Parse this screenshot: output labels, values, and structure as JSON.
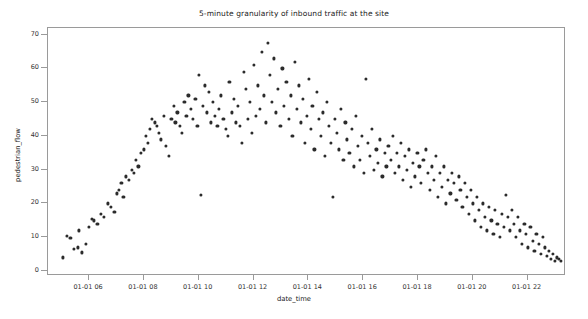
{
  "chart_data": {
    "type": "scatter",
    "title": "5-minute granularity of inbound traffic at the site",
    "xlabel": "date_time",
    "ylabel": "pedestrian_flow",
    "grid": false,
    "legend": null,
    "marker": {
      "color": "#2b2b2b",
      "size": 3,
      "shape": "circle"
    },
    "xlim": [
      4.5,
      23.4
    ],
    "ylim": [
      -1.5,
      72
    ],
    "ytick_values": [
      0,
      10,
      20,
      30,
      40,
      50,
      60,
      70
    ],
    "ytick_labels": [
      "0",
      "10",
      "20",
      "30",
      "40",
      "50",
      "60",
      "70"
    ],
    "xtick_values": [
      6,
      8,
      10,
      12,
      14,
      16,
      18,
      20,
      22
    ],
    "xtick_labels": [
      "01-01 06",
      "01-01 08",
      "01-01 10",
      "01-01 12",
      "01-01 14",
      "01-01 16",
      "01-01 18",
      "01-01 20",
      "01-01 22"
    ],
    "x_unit": "hour of 01-01",
    "points": [
      [
        5.05,
        4.0
      ],
      [
        5.2,
        10.5
      ],
      [
        5.32,
        9.8
      ],
      [
        5.45,
        6.5
      ],
      [
        5.58,
        7.0
      ],
      [
        5.62,
        12.0
      ],
      [
        5.75,
        5.5
      ],
      [
        5.88,
        8.0
      ],
      [
        6.0,
        13.0
      ],
      [
        6.1,
        15.5
      ],
      [
        6.18,
        15.0
      ],
      [
        6.3,
        14.0
      ],
      [
        6.42,
        17.0
      ],
      [
        6.55,
        16.0
      ],
      [
        6.68,
        20.0
      ],
      [
        6.8,
        19.0
      ],
      [
        6.92,
        17.5
      ],
      [
        7.0,
        23.0
      ],
      [
        7.08,
        24.0
      ],
      [
        7.18,
        26.0
      ],
      [
        7.25,
        22.0
      ],
      [
        7.35,
        28.0
      ],
      [
        7.45,
        27.0
      ],
      [
        7.55,
        30.0
      ],
      [
        7.62,
        29.0
      ],
      [
        7.7,
        33.0
      ],
      [
        7.8,
        31.0
      ],
      [
        7.9,
        35.0
      ],
      [
        8.0,
        36.0
      ],
      [
        8.08,
        40.0
      ],
      [
        8.15,
        38.0
      ],
      [
        8.22,
        42.0
      ],
      [
        8.3,
        45.0
      ],
      [
        8.4,
        44.0
      ],
      [
        8.48,
        43.0
      ],
      [
        8.55,
        41.0
      ],
      [
        8.62,
        39.0
      ],
      [
        8.72,
        46.0
      ],
      [
        8.8,
        37.0
      ],
      [
        8.9,
        34.0
      ],
      [
        9.0,
        45.0
      ],
      [
        9.08,
        49.0
      ],
      [
        9.15,
        44.0
      ],
      [
        9.22,
        47.0
      ],
      [
        9.3,
        43.0
      ],
      [
        9.4,
        41.0
      ],
      [
        9.48,
        50.0
      ],
      [
        9.55,
        46.0
      ],
      [
        9.62,
        52.0
      ],
      [
        9.72,
        48.0
      ],
      [
        9.8,
        45.0
      ],
      [
        9.88,
        51.0
      ],
      [
        9.95,
        43.0
      ],
      [
        10.02,
        58.0
      ],
      [
        10.08,
        22.5
      ],
      [
        10.15,
        49.0
      ],
      [
        10.22,
        55.0
      ],
      [
        10.3,
        47.0
      ],
      [
        10.38,
        53.0
      ],
      [
        10.45,
        44.0
      ],
      [
        10.52,
        50.0
      ],
      [
        10.6,
        46.0
      ],
      [
        10.68,
        43.0
      ],
      [
        10.75,
        48.0
      ],
      [
        10.82,
        52.0
      ],
      [
        10.9,
        45.0
      ],
      [
        10.98,
        42.0
      ],
      [
        11.05,
        40.0
      ],
      [
        11.12,
        56.0
      ],
      [
        11.2,
        47.0
      ],
      [
        11.28,
        51.0
      ],
      [
        11.35,
        44.0
      ],
      [
        11.42,
        49.0
      ],
      [
        11.5,
        43.0
      ],
      [
        11.58,
        38.0
      ],
      [
        11.65,
        59.0
      ],
      [
        11.72,
        54.0
      ],
      [
        11.8,
        45.0
      ],
      [
        11.88,
        50.0
      ],
      [
        11.95,
        41.0
      ],
      [
        12.02,
        61.0
      ],
      [
        12.08,
        46.0
      ],
      [
        12.15,
        55.0
      ],
      [
        12.22,
        48.0
      ],
      [
        12.3,
        65.0
      ],
      [
        12.38,
        52.0
      ],
      [
        12.45,
        44.0
      ],
      [
        12.52,
        67.5
      ],
      [
        12.6,
        58.0
      ],
      [
        12.68,
        50.0
      ],
      [
        12.75,
        63.0
      ],
      [
        12.82,
        47.0
      ],
      [
        12.9,
        54.0
      ],
      [
        12.98,
        43.0
      ],
      [
        13.05,
        60.0
      ],
      [
        13.12,
        49.0
      ],
      [
        13.2,
        56.0
      ],
      [
        13.28,
        45.0
      ],
      [
        13.35,
        52.0
      ],
      [
        13.42,
        40.0
      ],
      [
        13.5,
        62.0
      ],
      [
        13.58,
        48.0
      ],
      [
        13.65,
        55.0
      ],
      [
        13.72,
        44.0
      ],
      [
        13.8,
        51.0
      ],
      [
        13.88,
        38.0
      ],
      [
        13.95,
        46.0
      ],
      [
        14.02,
        57.0
      ],
      [
        14.08,
        42.0
      ],
      [
        14.15,
        49.0
      ],
      [
        14.22,
        36.0
      ],
      [
        14.3,
        53.0
      ],
      [
        14.38,
        45.0
      ],
      [
        14.45,
        40.0
      ],
      [
        14.52,
        47.0
      ],
      [
        14.6,
        34.0
      ],
      [
        14.68,
        50.0
      ],
      [
        14.75,
        43.0
      ],
      [
        14.82,
        38.0
      ],
      [
        14.9,
        22.0
      ],
      [
        14.98,
        45.0
      ],
      [
        15.05,
        41.0
      ],
      [
        15.12,
        36.0
      ],
      [
        15.2,
        48.0
      ],
      [
        15.28,
        33.0
      ],
      [
        15.35,
        44.0
      ],
      [
        15.42,
        39.0
      ],
      [
        15.5,
        35.0
      ],
      [
        15.58,
        42.0
      ],
      [
        15.65,
        31.0
      ],
      [
        15.72,
        46.0
      ],
      [
        15.8,
        37.0
      ],
      [
        15.88,
        33.0
      ],
      [
        15.95,
        40.0
      ],
      [
        16.02,
        29.0
      ],
      [
        16.1,
        57.0
      ],
      [
        16.18,
        38.0
      ],
      [
        16.25,
        34.0
      ],
      [
        16.32,
        42.0
      ],
      [
        16.4,
        30.0
      ],
      [
        16.48,
        36.0
      ],
      [
        16.55,
        32.0
      ],
      [
        16.62,
        39.0
      ],
      [
        16.7,
        28.0
      ],
      [
        16.78,
        35.0
      ],
      [
        16.85,
        31.0
      ],
      [
        16.92,
        37.0
      ],
      [
        17.0,
        33.0
      ],
      [
        17.08,
        40.0
      ],
      [
        17.15,
        29.0
      ],
      [
        17.22,
        35.0
      ],
      [
        17.3,
        31.0
      ],
      [
        17.38,
        38.0
      ],
      [
        17.45,
        27.0
      ],
      [
        17.52,
        34.0
      ],
      [
        17.6,
        30.0
      ],
      [
        17.68,
        36.0
      ],
      [
        17.75,
        25.0
      ],
      [
        17.82,
        32.0
      ],
      [
        17.9,
        28.0
      ],
      [
        17.98,
        35.0
      ],
      [
        18.05,
        31.0
      ],
      [
        18.12,
        26.0
      ],
      [
        18.2,
        33.0
      ],
      [
        18.28,
        36.0
      ],
      [
        18.35,
        29.0
      ],
      [
        18.42,
        24.0
      ],
      [
        18.5,
        31.0
      ],
      [
        18.58,
        27.0
      ],
      [
        18.65,
        34.0
      ],
      [
        18.72,
        22.0
      ],
      [
        18.8,
        29.0
      ],
      [
        18.88,
        25.0
      ],
      [
        18.95,
        31.0
      ],
      [
        19.02,
        20.0
      ],
      [
        19.1,
        27.0
      ],
      [
        19.18,
        23.0
      ],
      [
        19.25,
        29.0
      ],
      [
        19.32,
        26.0
      ],
      [
        19.4,
        21.0
      ],
      [
        19.48,
        28.0
      ],
      [
        19.55,
        24.0
      ],
      [
        19.62,
        19.0
      ],
      [
        19.7,
        26.0
      ],
      [
        19.78,
        22.0
      ],
      [
        19.85,
        17.0
      ],
      [
        19.92,
        24.0
      ],
      [
        20.0,
        20.0
      ],
      [
        20.08,
        15.0
      ],
      [
        20.15,
        22.0
      ],
      [
        20.22,
        18.0
      ],
      [
        20.3,
        13.0
      ],
      [
        20.38,
        20.0
      ],
      [
        20.45,
        16.0
      ],
      [
        20.52,
        12.0
      ],
      [
        20.6,
        19.0
      ],
      [
        20.68,
        15.0
      ],
      [
        20.75,
        11.0
      ],
      [
        20.82,
        18.0
      ],
      [
        20.9,
        14.0
      ],
      [
        20.98,
        10.0
      ],
      [
        21.05,
        17.0
      ],
      [
        21.12,
        13.0
      ],
      [
        21.2,
        22.5
      ],
      [
        21.28,
        16.0
      ],
      [
        21.35,
        12.0
      ],
      [
        21.42,
        18.0
      ],
      [
        21.5,
        14.0
      ],
      [
        21.58,
        10.0
      ],
      [
        21.65,
        16.0
      ],
      [
        21.72,
        12.0
      ],
      [
        21.8,
        8.0
      ],
      [
        21.88,
        14.0
      ],
      [
        21.95,
        11.0
      ],
      [
        22.02,
        7.0
      ],
      [
        22.1,
        13.0
      ],
      [
        22.18,
        9.0
      ],
      [
        22.25,
        6.0
      ],
      [
        22.32,
        11.0
      ],
      [
        22.4,
        8.0
      ],
      [
        22.48,
        5.0
      ],
      [
        22.55,
        10.0
      ],
      [
        22.62,
        7.0
      ],
      [
        22.7,
        4.5
      ],
      [
        22.78,
        6.0
      ],
      [
        22.85,
        3.5
      ],
      [
        22.92,
        5.0
      ],
      [
        23.0,
        3.0
      ],
      [
        23.08,
        4.0
      ],
      [
        23.15,
        3.5
      ],
      [
        23.22,
        3.0
      ]
    ]
  }
}
